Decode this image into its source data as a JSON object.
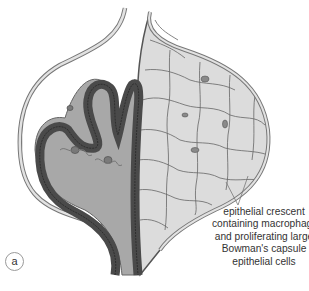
{
  "figure": {
    "panel_label": "a",
    "annotation": {
      "lines": [
        "epithelial crescent",
        "containing macrophages",
        "and proliferating large",
        "Bowman's capsule",
        "epithelial cells"
      ]
    },
    "colors": {
      "capillary_wall": "#4a4a4a",
      "mesangium": "#a8a8a8",
      "crescent_cells": "#dcdcdc",
      "cell_borders": "#555555",
      "nuclei": "#8a8a8a",
      "background": "#ffffff"
    }
  }
}
